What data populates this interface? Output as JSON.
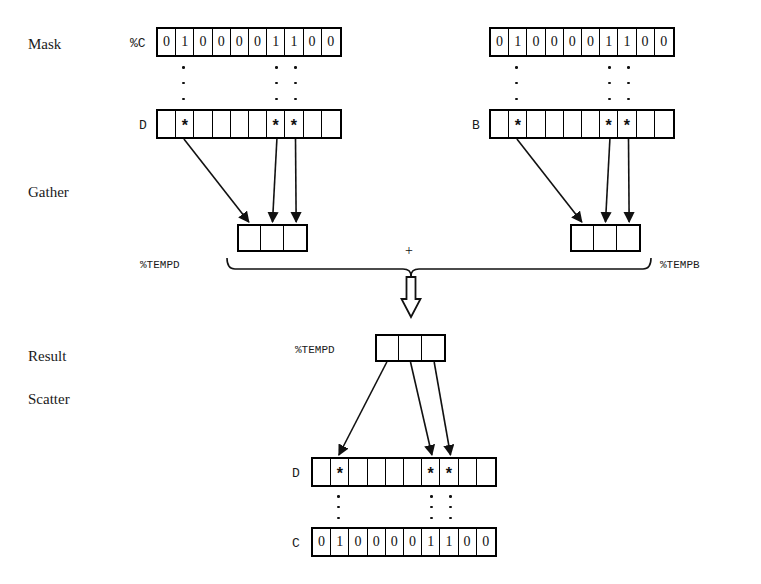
{
  "diagram": {
    "stage_labels": [
      {
        "name": "mask",
        "text": "Mask"
      },
      {
        "name": "gather",
        "text": "Gather"
      },
      {
        "name": "result",
        "text": "Result"
      },
      {
        "name": "scatter",
        "text": "Scatter"
      }
    ],
    "operator": "+",
    "mask_bits": [
      "0",
      "1",
      "0",
      "0",
      "0",
      "0",
      "1",
      "1",
      "0",
      "0"
    ],
    "active_positions": [
      2,
      7,
      8
    ],
    "star": "*",
    "blank": "",
    "temp_cells": [
      "",
      "",
      ""
    ],
    "vectors": [
      {
        "name": "mask-left",
        "label": "%C",
        "label_style": "mono"
      },
      {
        "name": "data-left",
        "label": "D",
        "label_style": "mono"
      },
      {
        "name": "mask-right",
        "label": "",
        "label_style": "mono"
      },
      {
        "name": "data-right",
        "label": "B",
        "label_style": "mono"
      },
      {
        "name": "tempd-gather",
        "label": "%TEMPD",
        "label_style": "mono"
      },
      {
        "name": "tempb-gather",
        "label": "%TEMPB",
        "label_style": "mono"
      },
      {
        "name": "tempd-result",
        "label": "%TEMPD",
        "label_style": "mono"
      },
      {
        "name": "data-bottom",
        "label": "D",
        "label_style": "mono"
      },
      {
        "name": "mask-bottom",
        "label": "C",
        "label_style": "mono"
      }
    ],
    "labels": {
      "mask_c_percent": "%C",
      "d_left": "D",
      "b_right": "B",
      "tempd_left": "%TEMPD",
      "tempb_right": "%TEMPB",
      "tempd_result": "%TEMPD",
      "d_bottom": "D",
      "c_bottom": "C"
    },
    "colors": {
      "ink": "#111111",
      "background": "#ffffff",
      "rule": "#000000"
    }
  }
}
